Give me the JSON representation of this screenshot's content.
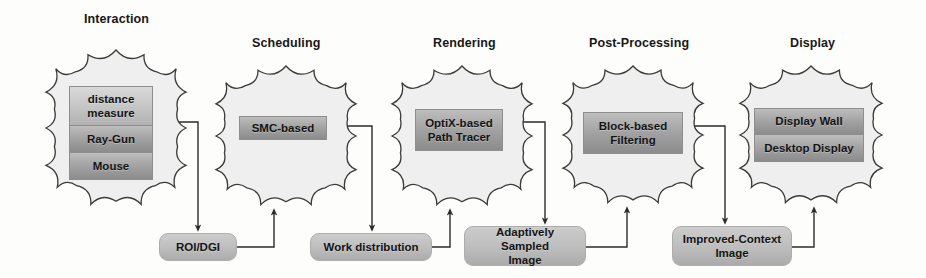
{
  "diagram": {
    "background_color": "#fdfdfc",
    "line_color": "#2b2b2b",
    "cloud_fill": "#efefef",
    "box_accent": "#b4b4b4"
  },
  "stages": [
    {
      "label": "Interaction",
      "label_x": 84,
      "label_y": 12,
      "cloud": {
        "x": 46,
        "y": 50,
        "w": 140,
        "h": 156
      },
      "inner": {
        "x": 69,
        "y": 77,
        "w": 84,
        "h": 112
      },
      "items": [
        {
          "text": "distance\nmeasure",
          "tone": "light",
          "h": 40
        },
        {
          "text": "Ray-Gun",
          "tone": "dark",
          "h": 27
        },
        {
          "text": "Mouse",
          "tone": "dark",
          "h": 27
        }
      ]
    },
    {
      "label": "Scheduling",
      "label_x": 252,
      "label_y": 36,
      "cloud": {
        "x": 216,
        "y": 66,
        "w": 140,
        "h": 140
      },
      "inner": {
        "x": 239,
        "y": 116,
        "w": 88,
        "h": 24
      },
      "items": [
        {
          "text": "SMC-based",
          "tone": "dark",
          "h": 24
        }
      ]
    },
    {
      "label": "Rendering",
      "label_x": 433,
      "label_y": 36,
      "cloud": {
        "x": 392,
        "y": 66,
        "w": 140,
        "h": 140
      },
      "inner": {
        "x": 415,
        "y": 109,
        "w": 88,
        "h": 42
      },
      "items": [
        {
          "text": "OptiX-based\nPath Tracer",
          "tone": "dark",
          "h": 42
        }
      ]
    },
    {
      "label": "Post-Processing",
      "label_x": 589,
      "label_y": 36,
      "cloud": {
        "x": 563,
        "y": 66,
        "w": 140,
        "h": 138
      },
      "inner": {
        "x": 583,
        "y": 112,
        "w": 100,
        "h": 42
      },
      "items": [
        {
          "text": "Block-based\nFiltering",
          "tone": "dark",
          "h": 42
        }
      ]
    },
    {
      "label": "Display",
      "label_x": 790,
      "label_y": 36,
      "cloud": {
        "x": 740,
        "y": 66,
        "w": 142,
        "h": 138
      },
      "inner": {
        "x": 754,
        "y": 108,
        "w": 110,
        "h": 54
      },
      "items": [
        {
          "text": "Display Wall",
          "tone": "dark",
          "h": 27
        },
        {
          "text": "Desktop Display",
          "tone": "dark",
          "h": 27
        }
      ]
    }
  ],
  "data_boxes": [
    {
      "text": "ROI/DGI",
      "x": 159,
      "y": 233,
      "w": 78,
      "h": 28
    },
    {
      "text": "Work distribution",
      "x": 310,
      "y": 233,
      "w": 122,
      "h": 28
    },
    {
      "text": "Adaptively Sampled\nImage",
      "x": 464,
      "y": 226,
      "w": 122,
      "h": 40
    },
    {
      "text": "Improved-Context\nImage",
      "x": 672,
      "y": 226,
      "w": 120,
      "h": 40
    }
  ],
  "connections": [
    {
      "from": "Interaction",
      "to": "ROI/DGI",
      "kind": "cloud-to-box"
    },
    {
      "from": "ROI/DGI",
      "to": "Scheduling",
      "kind": "box-to-cloud"
    },
    {
      "from": "Scheduling",
      "to": "Work distribution",
      "kind": "cloud-to-box"
    },
    {
      "from": "Work distribution",
      "to": "Rendering",
      "kind": "box-to-cloud"
    },
    {
      "from": "Rendering",
      "to": "Adaptively Sampled Image",
      "kind": "cloud-to-box"
    },
    {
      "from": "Adaptively Sampled Image",
      "to": "Post-Processing",
      "kind": "box-to-cloud"
    },
    {
      "from": "Post-Processing",
      "to": "Improved-Context Image",
      "kind": "cloud-to-box"
    },
    {
      "from": "Improved-Context Image",
      "to": "Display",
      "kind": "box-to-cloud"
    }
  ]
}
